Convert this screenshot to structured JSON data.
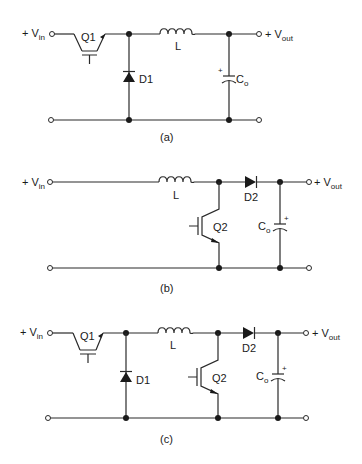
{
  "diagram": {
    "type": "schematic",
    "circuits": [
      {
        "id": "a",
        "caption": "(a)",
        "input_label": "+ V",
        "input_sub": "in",
        "output_label": "+ V",
        "output_sub": "out",
        "components": {
          "switch": "Q1",
          "diode": "D1",
          "inductor": "L",
          "capacitor": "C",
          "capacitor_sub": "o",
          "cap_polarity": "+"
        }
      },
      {
        "id": "b",
        "caption": "(b)",
        "input_label": "+ V",
        "input_sub": "in",
        "output_label": "+ V",
        "output_sub": "out",
        "components": {
          "switch": "Q2",
          "diode": "D2",
          "inductor": "L",
          "capacitor": "C",
          "capacitor_sub": "o",
          "cap_polarity": "+"
        }
      },
      {
        "id": "c",
        "caption": "(c)",
        "input_label": "+ V",
        "input_sub": "in",
        "output_label": "+ V",
        "output_sub": "out",
        "components": {
          "switch1": "Q1",
          "diode1": "D1",
          "inductor": "L",
          "switch2": "Q2",
          "diode2": "D2",
          "capacitor": "C",
          "capacitor_sub": "o",
          "cap_polarity": "+"
        }
      }
    ],
    "colors": {
      "wire": "#2a2a2a",
      "background": "#ffffff"
    }
  }
}
